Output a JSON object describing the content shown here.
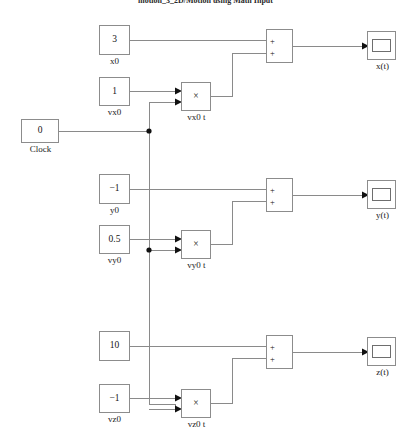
{
  "diagram": {
    "title": "motion_3_2D/Motion using Math Input",
    "background_color": "#ffffff",
    "wire_color": "#8a8a8a",
    "block_border_color": "#8c8c8c",
    "block_fill_color": "#ffffff",
    "text_color": "#141414"
  },
  "blocks": {
    "clock": {
      "value": "0",
      "label": "Clock",
      "type": "constant-block"
    },
    "x0": {
      "value": "3",
      "label": "x0",
      "type": "constant-block"
    },
    "vx0": {
      "value": "1",
      "label": "vx0",
      "type": "constant-block"
    },
    "vx0t": {
      "value": "×",
      "label": "vx0 t",
      "type": "product-block"
    },
    "sum_x": {
      "sign1": "+",
      "sign2": "+",
      "label": "",
      "type": "sum-block"
    },
    "scope_x": {
      "label": "x(t)",
      "type": "scope-block"
    },
    "y0": {
      "value": "−1",
      "label": "y0",
      "type": "constant-block"
    },
    "vy0": {
      "value": "0.5",
      "label": "vy0",
      "type": "constant-block"
    },
    "vy0t": {
      "value": "×",
      "label": "vy0 t",
      "type": "product-block"
    },
    "sum_y": {
      "sign1": "+",
      "sign2": "+",
      "label": "",
      "type": "sum-block"
    },
    "scope_y": {
      "label": "y(t)",
      "type": "scope-block"
    },
    "z0": {
      "value": "10",
      "label": "",
      "type": "constant-block"
    },
    "vz0": {
      "value": "−1",
      "label": "vz0",
      "type": "constant-block"
    },
    "vz0t": {
      "value": "×",
      "label": "vz0 t",
      "type": "product-block"
    },
    "sum_z": {
      "sign1": "+",
      "sign2": "+",
      "label": "",
      "type": "sum-block"
    },
    "scope_z": {
      "label": "z(t)",
      "type": "scope-block"
    }
  }
}
